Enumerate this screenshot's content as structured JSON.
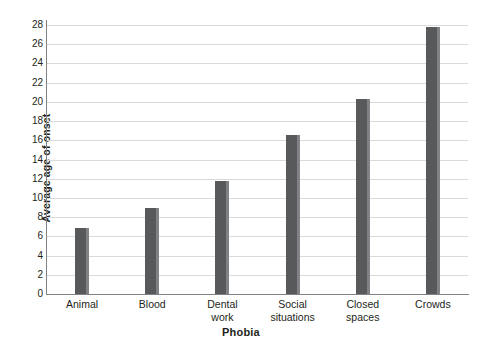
{
  "chart_data": {
    "type": "bar",
    "title": "",
    "xlabel": "Phobia",
    "ylabel": "Average age of onset",
    "categories": [
      "Animal",
      "Blood",
      "Dental work",
      "Social situations",
      "Closed spaces",
      "Crowds"
    ],
    "category_lines": [
      [
        "Animal"
      ],
      [
        "Blood"
      ],
      [
        "Dental",
        "work"
      ],
      [
        "Social",
        "situations"
      ],
      [
        "Closed",
        "spaces"
      ],
      [
        "Crowds"
      ]
    ],
    "values": [
      6.9,
      9.0,
      11.8,
      16.5,
      20.3,
      27.8
    ],
    "ylim": [
      0,
      28
    ],
    "ytick_step": 2,
    "yticks": [
      0,
      2,
      4,
      6,
      8,
      10,
      12,
      14,
      16,
      18,
      20,
      22,
      24,
      26,
      28
    ],
    "grid": true,
    "legend": false,
    "colors": {
      "bar": "#58595b",
      "bar_edge": "#808285",
      "gridline": "#dadada",
      "axis": "#808285",
      "text": "#231f20",
      "background": "#ffffff"
    }
  }
}
